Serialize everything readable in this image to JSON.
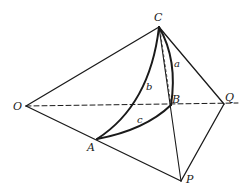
{
  "figure": {
    "points": {
      "O": {
        "label": "O",
        "x": 26,
        "y": 106
      },
      "C": {
        "label": "C",
        "x": 159,
        "y": 27
      },
      "Q": {
        "label": "Q",
        "x": 224,
        "y": 104
      },
      "B": {
        "label": "B",
        "x": 171,
        "y": 105
      },
      "A": {
        "label": "A",
        "x": 97,
        "y": 139
      },
      "P": {
        "label": "P",
        "x": 181,
        "y": 181
      }
    },
    "arcs": {
      "a": {
        "label": "a",
        "from": "C",
        "to": "B"
      },
      "b": {
        "label": "b",
        "from": "C",
        "to": "A"
      },
      "c": {
        "label": "c",
        "from": "A",
        "to": "B"
      }
    },
    "colors": {
      "stroke": "#1a1a1a",
      "background": "#ffffff"
    }
  }
}
